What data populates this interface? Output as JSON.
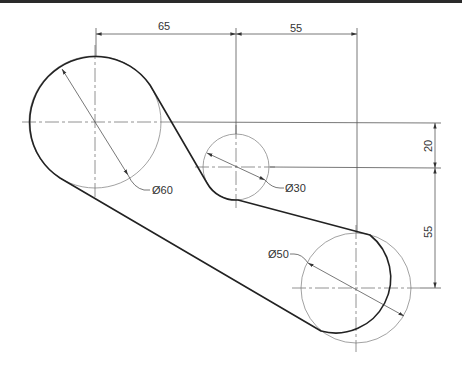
{
  "drawing": {
    "type": "technical-drawing",
    "units": "mm",
    "circles": [
      {
        "id": "large",
        "diameter_label": "Ø60",
        "diameter": 60
      },
      {
        "id": "small",
        "diameter_label": "Ø30",
        "diameter": 30
      },
      {
        "id": "right",
        "diameter_label": "Ø50",
        "diameter": 50
      }
    ],
    "dimensions": {
      "horizontal": [
        {
          "label": "65",
          "value": 65,
          "between": "large-center to small-center"
        },
        {
          "label": "55",
          "value": 55,
          "between": "small-center to right-center"
        }
      ],
      "vertical": [
        {
          "label": "20",
          "value": 20,
          "between": "large-center to small-center"
        },
        {
          "label": "55",
          "value": 55,
          "between": "small-center to right-center"
        }
      ]
    },
    "colors": {
      "outline": "#222222",
      "construction": "#8a8a8a",
      "topbar": "#2a2a2a"
    }
  }
}
